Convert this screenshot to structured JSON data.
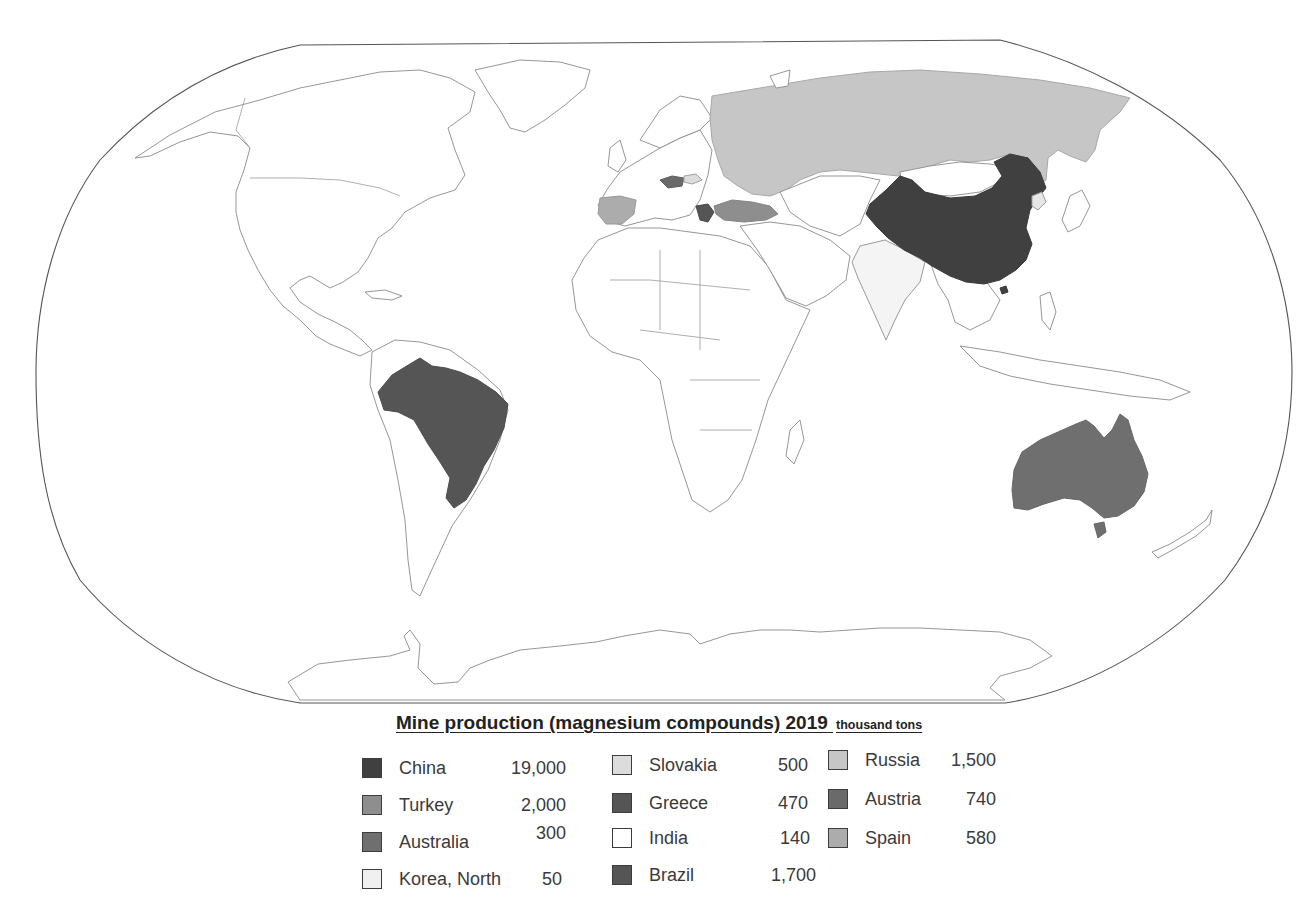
{
  "map": {
    "projection": "Robinson (world)",
    "highlighted_countries": [
      "China",
      "Brazil",
      "Australia",
      "Russia",
      "Turkey",
      "Spain",
      "Greece",
      "Austria",
      "Slovakia",
      "India",
      "Korea, North"
    ]
  },
  "legend": {
    "title": "Mine production (magnesium compounds) 2019",
    "unit": "thousand tons",
    "items": [
      {
        "name": "China",
        "value": "19,000",
        "color": "#404040"
      },
      {
        "name": "Turkey",
        "value": "2,000",
        "color": "#8e8e8e"
      },
      {
        "name": "Australia",
        "value": "300",
        "color": "#6f6f6f"
      },
      {
        "name": "Korea, North",
        "value": "50",
        "color": "#e6e6e6"
      },
      {
        "name": "Slovakia",
        "value": "500",
        "color": "#dcdcdc"
      },
      {
        "name": "Greece",
        "value": "470",
        "color": "#555555"
      },
      {
        "name": "India",
        "value": "140",
        "color": "#f4f4f4"
      },
      {
        "name": "Brazil",
        "value": "1,700",
        "color": "#555555"
      },
      {
        "name": "Russia",
        "value": "1,500",
        "color": "#c6c6c6"
      },
      {
        "name": "Austria",
        "value": "740",
        "color": "#6a6a6a"
      },
      {
        "name": "Spain",
        "value": "580",
        "color": "#acacac"
      }
    ]
  }
}
